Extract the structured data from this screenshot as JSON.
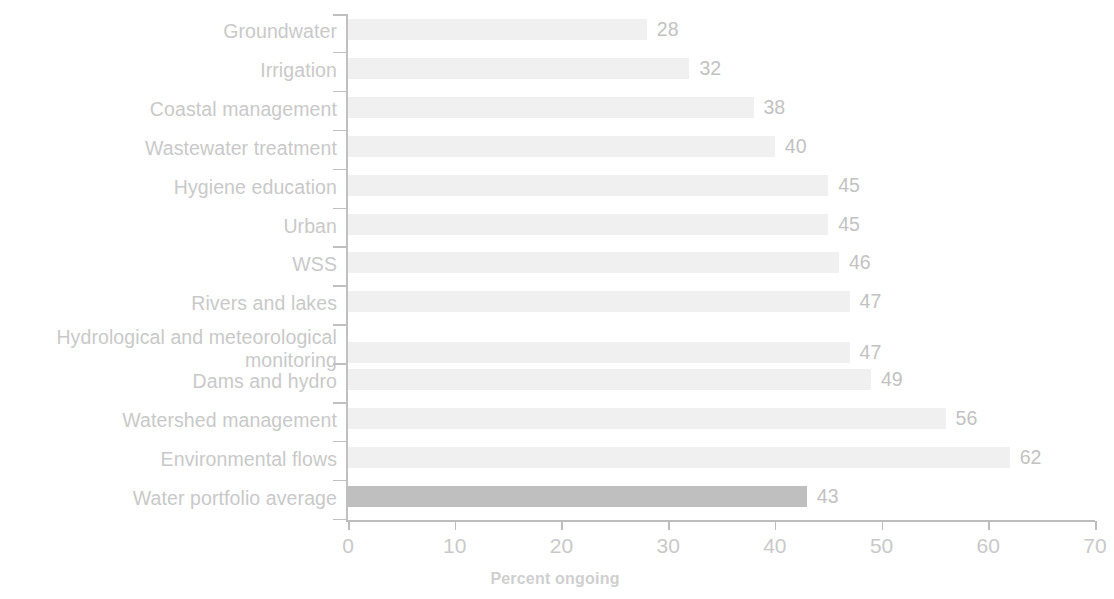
{
  "chart_data": {
    "type": "bar",
    "orientation": "horizontal",
    "title": "",
    "subtitle": "",
    "xlabel": "Percent ongoing",
    "ylabel": "",
    "xlim": [
      0,
      70
    ],
    "xticks": [
      0,
      10,
      20,
      30,
      40,
      50,
      60,
      70
    ],
    "xtick_labels": [
      "0",
      "10",
      "20",
      "30",
      "40",
      "50",
      "60",
      "70"
    ],
    "grid": false,
    "legend": null,
    "categories": [
      "Groundwater",
      "Irrigation",
      "Coastal management",
      "Wastewater treatment",
      "Hygiene education",
      "Urban",
      "WSS",
      "Rivers and lakes",
      "Hydrological and meteorological\nmonitoring",
      "Dams and hydro",
      "Watershed management",
      "Environmental flows",
      "Water portfolio average"
    ],
    "values": [
      28,
      32,
      38,
      40,
      45,
      45,
      46,
      47,
      47,
      49,
      56,
      62,
      43
    ],
    "value_labels": [
      "28",
      "32",
      "38",
      "40",
      "45",
      "45",
      "46",
      "47",
      "47",
      "49",
      "56",
      "62",
      "43"
    ],
    "highlight_index": 12,
    "colors": {
      "bar": "#f0f0f0",
      "bar_highlight": "#bfbfbf",
      "axis": "#c0c0c0",
      "text": "#c9c9c9",
      "background": "#ffffff"
    }
  }
}
